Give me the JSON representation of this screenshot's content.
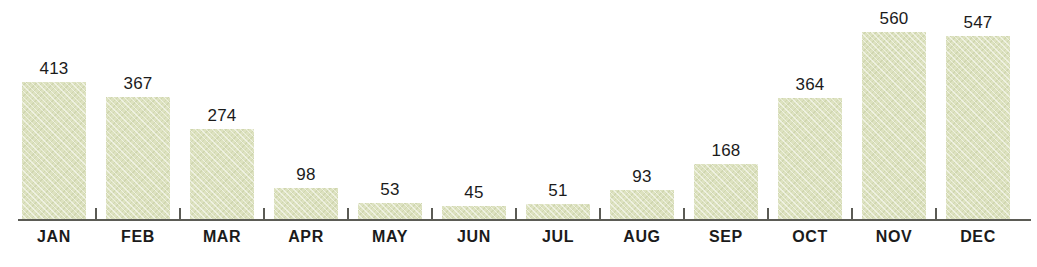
{
  "chart_data": {
    "type": "bar",
    "title": "",
    "subtitle": "",
    "xlabel": "",
    "ylabel": "",
    "categories": [
      "JAN",
      "FEB",
      "MAR",
      "APR",
      "MAY",
      "JUN",
      "JUL",
      "AUG",
      "SEP",
      "OCT",
      "NOV",
      "DEC"
    ],
    "values": [
      413,
      367,
      274,
      98,
      53,
      45,
      51,
      93,
      168,
      364,
      560,
      547
    ],
    "value_labels": [
      "413",
      "367",
      "274",
      "98",
      "53",
      "45",
      "51",
      "93",
      "168",
      "364",
      "560",
      "547"
    ],
    "data_labels_shown": true,
    "ylim": [
      0,
      560
    ],
    "grid": false,
    "legend": false,
    "legend_position": "none",
    "y_axis_visible": false,
    "x_axis_visible": true,
    "annotations": []
  },
  "style": {
    "bar_color": "#dde2c0",
    "bar_texture": "diagonal-weave",
    "axis_color": "#5b5b55",
    "label_color": "#1b1b1b",
    "background_color": "#ffffff"
  }
}
